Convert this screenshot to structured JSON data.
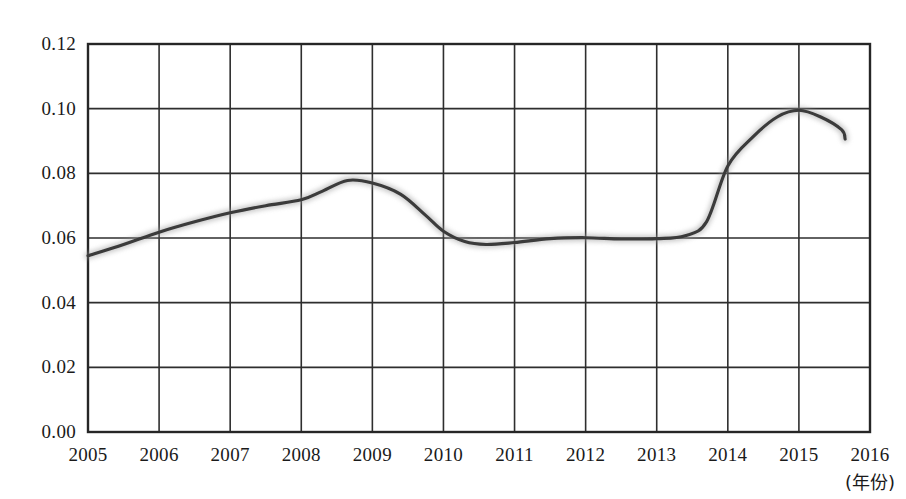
{
  "chart_data": {
    "type": "line",
    "title": "",
    "subtitle": "",
    "xlabel": "(年份)",
    "ylabel": "",
    "xlim": [
      2005,
      2016
    ],
    "ylim": [
      0.0,
      0.12
    ],
    "grid": true,
    "legend": "none",
    "x_tick_labels": [
      "2005",
      "2006",
      "2007",
      "2008",
      "2009",
      "2010",
      "2011",
      "2012",
      "2013",
      "2014",
      "2015",
      "2016"
    ],
    "y_tick_labels": [
      "0.12",
      "0.10",
      "0.08",
      "0.06",
      "0.04",
      "0.02",
      "0.00"
    ],
    "y_ticks": [
      0.12,
      0.1,
      0.08,
      0.06,
      0.04,
      0.02,
      0.0
    ],
    "x": [
      2005,
      2006,
      2007,
      2008,
      2009,
      2010,
      2011,
      2012,
      2013,
      2014,
      2015,
      2016
    ],
    "series": [
      {
        "name": "比值",
        "color": "#3a3a3a",
        "values": [
          0.0545,
          0.0618,
          0.0678,
          0.0718,
          0.077,
          0.0601,
          0.0586,
          0.0601,
          0.0598,
          0.0823,
          0.0995,
          0.0906
        ]
      }
    ],
    "annotations": [
      {
        "text": "曲线峰值出现在 2008–2009 之间，约 0.078",
        "x": 2008.6,
        "y": 0.078
      },
      {
        "text": "最低点在 2011 附近，约 0.058",
        "x": 2011.0,
        "y": 0.058
      },
      {
        "text": "最高点在 2015 附近，约 0.100",
        "x": 2015.0,
        "y": 0.1
      }
    ],
    "dense_points": [
      {
        "x": 2005.0,
        "y": 0.0545
      },
      {
        "x": 2005.5,
        "y": 0.058
      },
      {
        "x": 2006.0,
        "y": 0.0618
      },
      {
        "x": 2006.5,
        "y": 0.065
      },
      {
        "x": 2007.0,
        "y": 0.0678
      },
      {
        "x": 2007.5,
        "y": 0.07
      },
      {
        "x": 2008.0,
        "y": 0.0718
      },
      {
        "x": 2008.3,
        "y": 0.0745
      },
      {
        "x": 2008.65,
        "y": 0.0778
      },
      {
        "x": 2009.0,
        "y": 0.077
      },
      {
        "x": 2009.4,
        "y": 0.0735
      },
      {
        "x": 2009.75,
        "y": 0.067
      },
      {
        "x": 2010.0,
        "y": 0.0621
      },
      {
        "x": 2010.3,
        "y": 0.0589
      },
      {
        "x": 2010.6,
        "y": 0.058
      },
      {
        "x": 2011.0,
        "y": 0.0586
      },
      {
        "x": 2011.5,
        "y": 0.0598
      },
      {
        "x": 2012.0,
        "y": 0.0601
      },
      {
        "x": 2012.5,
        "y": 0.0597
      },
      {
        "x": 2013.0,
        "y": 0.0598
      },
      {
        "x": 2013.4,
        "y": 0.0607
      },
      {
        "x": 2013.7,
        "y": 0.065
      },
      {
        "x": 2014.0,
        "y": 0.0823
      },
      {
        "x": 2014.35,
        "y": 0.0912
      },
      {
        "x": 2014.7,
        "y": 0.0975
      },
      {
        "x": 2015.0,
        "y": 0.0995
      },
      {
        "x": 2015.3,
        "y": 0.0975
      },
      {
        "x": 2015.6,
        "y": 0.0935
      },
      {
        "x": 2015.65,
        "y": 0.0906
      }
    ]
  },
  "axis": {
    "x_note": "(年份)"
  }
}
